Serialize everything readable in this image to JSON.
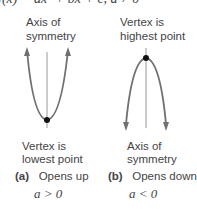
{
  "formula": "f(x) = ax² + bx + c, a ≠ 0",
  "panel_a": {
    "top_label_1": "Axis of",
    "top_label_2": "symmetry",
    "bottom_label_1": "Vertex is",
    "bottom_label_2": "lowest point",
    "tag": "(a)",
    "caption": "Opens up",
    "condition": "a > 0"
  },
  "panel_b": {
    "top_label_1": "Vertex is",
    "top_label_2": "highest point",
    "bottom_label_1": "Axis of",
    "bottom_label_2": "symmetry",
    "tag": "(b)",
    "caption": "Opens down",
    "condition": "a < 0"
  },
  "colors": {
    "curve": "#707070",
    "axis": "#888888",
    "vertex": "#111111",
    "text": "#444444"
  }
}
